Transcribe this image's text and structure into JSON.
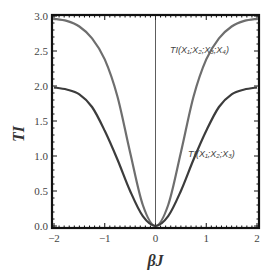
{
  "chart_data": {
    "type": "line",
    "title": "",
    "xlabel": "βJ",
    "ylabel": "TI",
    "xlim": [
      -2,
      2
    ],
    "ylim": [
      0,
      3
    ],
    "x_ticks": [
      "-2",
      "-1",
      "0",
      "1",
      "2"
    ],
    "y_ticks": [
      "0.0",
      "0.5",
      "1.0",
      "1.5",
      "2.0",
      "2.5",
      "3.0"
    ],
    "grid": false,
    "legend": "none",
    "x": [
      -2.0,
      -1.75,
      -1.5,
      -1.25,
      -1.0,
      -0.75,
      -0.5,
      -0.25,
      0.0,
      0.25,
      0.5,
      0.75,
      1.0,
      1.25,
      1.5,
      1.75,
      2.0
    ],
    "series": [
      {
        "name": "TI(X1;X2;X3;X4)",
        "color": "#6e6e6e",
        "values": [
          2.96,
          2.93,
          2.85,
          2.68,
          2.38,
          1.85,
          1.05,
          0.3,
          0.0,
          0.3,
          1.05,
          1.85,
          2.38,
          2.68,
          2.85,
          2.93,
          2.96
        ]
      },
      {
        "name": "TI(X1;X2;X3)",
        "color": "#3c3c3c",
        "values": [
          1.98,
          1.95,
          1.88,
          1.7,
          1.36,
          0.95,
          0.5,
          0.14,
          0.0,
          0.14,
          0.5,
          0.95,
          1.36,
          1.7,
          1.88,
          1.95,
          1.98
        ]
      }
    ],
    "annotations": [
      {
        "text": "TI(X₁;X₂;X₃;X₄)",
        "x": 1.0,
        "y": 2.35
      },
      {
        "text": "TI(X₁;X₂;X₃)",
        "x": 1.05,
        "y": 0.85
      }
    ],
    "reference_lines": [
      {
        "orientation": "vertical",
        "x": 0
      }
    ]
  },
  "labels": {
    "xlabel": "βJ",
    "ylabel": "TI",
    "annot4": "TI(X₁;X₂;X₃;X₄)",
    "annot3": "TI(X₁;X₂;X₃)"
  }
}
